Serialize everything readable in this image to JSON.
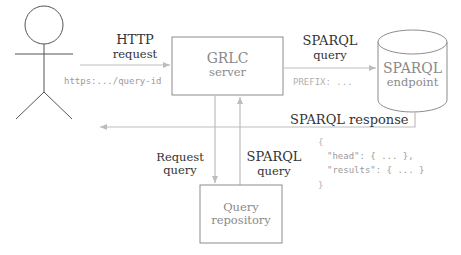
{
  "actor": {
    "label": "user"
  },
  "nodes": {
    "grlc_server": {
      "title": "GRLC",
      "subtitle": "server"
    },
    "sparql_endpoint": {
      "title": "SPARQL",
      "subtitle": "endpoint"
    },
    "query_repository": {
      "title": "Query",
      "subtitle": "repository"
    }
  },
  "edges": {
    "http_request": {
      "title": "HTTP",
      "subtitle": "request",
      "example": "https:.../query-id"
    },
    "sparql_query_out": {
      "title": "SPARQL",
      "subtitle": "query",
      "example": "PREFIX: ..."
    },
    "sparql_response": {
      "label": "SPARQL response"
    },
    "request_query": {
      "title": "Request",
      "subtitle": "query"
    },
    "sparql_query_in": {
      "title": "SPARQL",
      "subtitle": "query"
    }
  },
  "response_json": {
    "open": "{",
    "line1": "\"head\": { ... },",
    "line2": "\"results\": { ... }",
    "close": "}"
  },
  "colors": {
    "stroke": "#8c8c8c",
    "arrow": "#b5b5b5",
    "text": "#333333",
    "muted": "#9a9a9a"
  }
}
